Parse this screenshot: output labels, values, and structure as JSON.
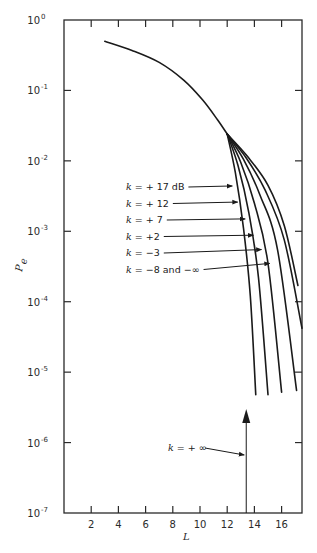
{
  "chart_data": {
    "type": "line",
    "title": "",
    "xlabel": "L",
    "ylabel": "P_e",
    "xlim": [
      0,
      17.5
    ],
    "ylim": [
      1e-07,
      1
    ],
    "yscale": "log",
    "grid": false,
    "x_ticks": [
      2,
      4,
      6,
      8,
      10,
      12,
      14,
      16
    ],
    "x_tick_labels": [
      "2",
      "4",
      "6",
      "8",
      "10",
      "12",
      "14",
      "16"
    ],
    "y_ticks": [
      1,
      0.1,
      0.01,
      0.001,
      0.0001,
      1e-05,
      1e-06,
      1e-07
    ],
    "y_tick_labels": [
      {
        "base": "10",
        "exp": "0"
      },
      {
        "base": "10",
        "exp": "-1"
      },
      {
        "base": "10",
        "exp": "-2"
      },
      {
        "base": "10",
        "exp": "-3"
      },
      {
        "base": "10",
        "exp": "-4"
      },
      {
        "base": "10",
        "exp": "-5"
      },
      {
        "base": "10",
        "exp": "-6"
      },
      {
        "base": "10",
        "exp": "-7"
      }
    ],
    "common_segment": {
      "x": [
        3.0,
        5.0,
        7.0,
        8.8,
        10.2,
        11.3,
        12.0
      ],
      "y": [
        0.5,
        0.37,
        0.25,
        0.14,
        0.073,
        0.038,
        0.024
      ]
    },
    "series": [
      {
        "name": "k = + 17 dB",
        "x": [
          12.0,
          12.6,
          13.2,
          13.7,
          14.1
        ],
        "y": [
          0.024,
          0.0068,
          0.0011,
          0.00012,
          4.8e-06
        ]
      },
      {
        "name": "k = + 12",
        "x": [
          12.0,
          12.8,
          13.6,
          14.3,
          15.0
        ],
        "y": [
          0.024,
          0.0085,
          0.0018,
          0.00022,
          4.8e-06
        ]
      },
      {
        "name": "k = + 7",
        "x": [
          12.0,
          13.0,
          14.0,
          15.0,
          16.0
        ],
        "y": [
          0.024,
          0.0095,
          0.0025,
          0.00035,
          5.2e-06
        ]
      },
      {
        "name": "k = +2",
        "x": [
          12.0,
          13.2,
          14.4,
          15.7,
          17.1
        ],
        "y": [
          0.024,
          0.0105,
          0.0033,
          0.00055,
          5.5e-06
        ]
      },
      {
        "name": "k = -3",
        "x": [
          12.0,
          13.4,
          14.8,
          16.2,
          17.5
        ],
        "y": [
          0.024,
          0.011,
          0.0038,
          0.00075,
          4.2e-05
        ]
      },
      {
        "name": "k = -8 and -∞",
        "x": [
          12.0,
          13.5,
          15.0,
          16.2,
          17.2
        ],
        "y": [
          0.024,
          0.0115,
          0.0045,
          0.0012,
          0.00017
        ]
      }
    ],
    "annotations": [
      {
        "text": "k = + ∞",
        "type": "vertical-arrow",
        "x": 13.4,
        "y_from": 1e-07,
        "y_to": 3e-06
      }
    ]
  },
  "labels": {
    "legend": [
      {
        "k": "k",
        "eq": " = + 17 dB",
        "target": [
          12.45,
          0.0044
        ]
      },
      {
        "k": "k",
        "eq": " = + 12",
        "target": [
          12.85,
          0.0026
        ]
      },
      {
        "k": "k",
        "eq": " = + 7",
        "target": [
          13.4,
          0.0015
        ]
      },
      {
        "k": "k",
        "eq": " = +2",
        "target": [
          14.0,
          0.00088
        ]
      },
      {
        "k": "k",
        "eq": " = −3",
        "target": [
          14.6,
          0.00055
        ]
      },
      {
        "k": "k",
        "eq": " = −8 and −∞",
        "target": [
          15.2,
          0.00035
        ]
      }
    ],
    "infinity_label": {
      "k": "k",
      "eq": " = + ∞"
    },
    "xlabel": "L",
    "ylabel_main": "P",
    "ylabel_sub": "e"
  }
}
